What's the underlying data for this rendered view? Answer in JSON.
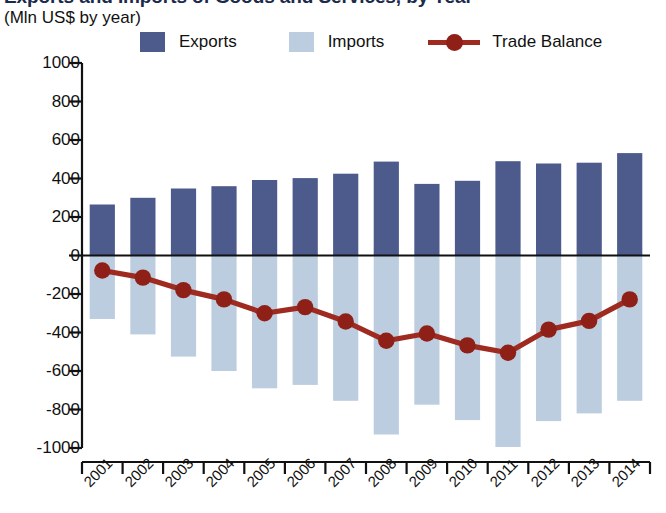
{
  "title": "Exports and Imports of Goods and Services, by Year",
  "subtitle": "(Mln US$ by year)",
  "legend": {
    "exports_label": "Exports",
    "imports_label": "Imports",
    "balance_label": "Trade Balance"
  },
  "colors": {
    "exports": "#4d5a8c",
    "imports": "#bdcde0",
    "balance": "#9e2a20",
    "balance_marker": "#8e2017",
    "axis": "#111111",
    "background": "#ffffff"
  },
  "chart_data": {
    "type": "bar",
    "title": "Exports and Imports of Goods and Services, by Year",
    "subtitle": "(Mln US$ by year)",
    "xlabel": "",
    "ylabel": "Mln US$",
    "ylim": [
      -1000,
      1000
    ],
    "ytick_step": 200,
    "yticks": [
      1000,
      800,
      600,
      400,
      200,
      0,
      -200,
      -400,
      -600,
      -800,
      -1000
    ],
    "ytick_labels": [
      "1000",
      "800",
      "600",
      "400",
      "200",
      "0",
      "-200",
      "-400",
      "-600",
      "-800",
      "-1000"
    ],
    "grid": false,
    "legend_position": "top",
    "categories": [
      "2001",
      "2002",
      "2003",
      "2004",
      "2005",
      "2006",
      "2007",
      "2008",
      "2009",
      "2010",
      "2011",
      "2012",
      "2013",
      "2014"
    ],
    "series": [
      {
        "name": "Exports",
        "type": "bar",
        "color": "#4d5a8c",
        "values": [
          265,
          300,
          348,
          360,
          392,
          402,
          425,
          488,
          372,
          388,
          490,
          478,
          482,
          532
        ]
      },
      {
        "name": "Imports",
        "type": "bar",
        "color": "#bdcde0",
        "values": [
          -330,
          -410,
          -525,
          -600,
          -690,
          -672,
          -755,
          -930,
          -775,
          -855,
          -995,
          -860,
          -820,
          -755
        ]
      },
      {
        "name": "Trade Balance",
        "type": "line",
        "color": "#9e2a20",
        "values": [
          -78,
          -115,
          -180,
          -228,
          -300,
          -268,
          -343,
          -443,
          -405,
          -467,
          -505,
          -385,
          -340,
          -228
        ]
      }
    ]
  }
}
